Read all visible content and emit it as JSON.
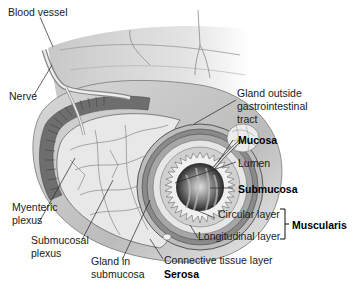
{
  "diagram": {
    "labels": {
      "blood_vessel": "Blood vessel",
      "nerve": "Nerve",
      "gland_outside_1": "Gland outside",
      "gland_outside_2": "gastrointestinal",
      "gland_outside_3": "tract",
      "mucosa": "Mucosa",
      "lumen": "Lumen",
      "submucosa": "Submucosa",
      "circular_layer": "Circular layer",
      "longitudinal_layer": "Longitudinal layer",
      "muscularis": "Muscularis",
      "connective_tissue": "Connective tissue layer",
      "serosa": "Serosa",
      "myenteric_1": "Myenteric",
      "myenteric_2": "plexus",
      "submucosal_1": "Submucosal",
      "submucosal_2": "plexus",
      "gland_in_1": "Gland in",
      "gland_in_2": "submucosa"
    },
    "bold_labels": [
      "Mucosa",
      "Submucosa",
      "Muscularis",
      "Serosa"
    ]
  }
}
